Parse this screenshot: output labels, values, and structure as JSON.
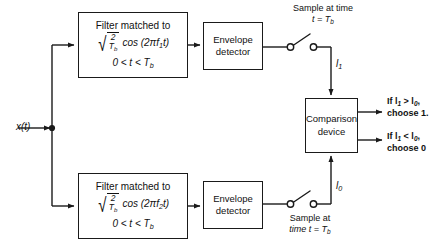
{
  "diagram": {
    "input": {
      "label": "x(t)"
    },
    "upper_branch": {
      "filter": {
        "title": "Filter matched to",
        "radicand_num": "2",
        "radicand_den": "T",
        "radicand_den_sub": "b",
        "cos_expr": "cos (2πf",
        "cos_sub": "1",
        "cos_tail": "t)",
        "condition_lead": "0 < t < T",
        "condition_sub": "b"
      },
      "envelope": {
        "line1": "Envelope",
        "line2": "detector"
      },
      "sampler": {
        "line1": "Sample at time",
        "line2_lead": "t = T",
        "line2_sub": "b"
      },
      "current": {
        "symbol": "l",
        "sub": "1"
      }
    },
    "lower_branch": {
      "filter": {
        "title": "Filter matched to",
        "radicand_num": "2",
        "radicand_den": "T",
        "radicand_den_sub": "b",
        "cos_expr": "cos (2πf",
        "cos_sub": "2",
        "cos_tail": "t)",
        "condition_lead": "0 < t < T",
        "condition_sub": "b"
      },
      "envelope": {
        "line1": "Envelope",
        "line2": "detector"
      },
      "sampler": {
        "line1": "Sample at",
        "line2_lead": "time t = T",
        "line2_sub": "b"
      },
      "current": {
        "symbol": "l",
        "sub": "0"
      }
    },
    "comparison": {
      "line1": "Comparison",
      "line2": "device"
    },
    "outputs": [
      {
        "line1_lead": "If l",
        "line1_sub1": "1",
        "line1_mid": " > l",
        "line1_sub2": "0",
        "line1_tail": ",",
        "line2": "choose 1."
      },
      {
        "line1_lead": "If l",
        "line1_sub1": "1",
        "line1_mid": " < l",
        "line1_sub2": "0",
        "line1_tail": ",",
        "line2": "choose 0"
      }
    ],
    "colors": {
      "line": "#1a1a1a",
      "text": "#111111",
      "background": "#ffffff"
    }
  }
}
